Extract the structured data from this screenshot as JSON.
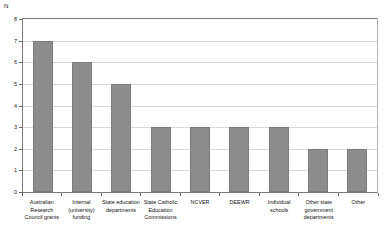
{
  "chart_data": {
    "type": "bar",
    "title": "",
    "subtitle": "",
    "xlabel": "",
    "ylabel": "N",
    "ylim": [
      0,
      8
    ],
    "ytick_labels": [
      "8",
      "7",
      "6",
      "5",
      "4",
      "3",
      "2",
      "1",
      "0"
    ],
    "ytick_values": [
      8,
      7,
      6,
      5,
      4,
      3,
      2,
      1,
      0
    ],
    "grid": true,
    "legend": null,
    "legend_position": "none",
    "bar_color": "#8c8c8c",
    "categories": [
      "Australian Research Council grants",
      "Internal (university) funding",
      "State education departments",
      "State Catholic Education Commissions",
      "NCVER",
      "DEEWR",
      "Individual schools",
      "Other state government departments",
      "Other"
    ],
    "values": [
      7,
      6,
      5,
      3,
      3,
      3,
      3,
      2,
      2
    ],
    "series": [
      {
        "name": "N",
        "values": [
          7,
          6,
          5,
          3,
          3,
          3,
          3,
          2,
          2
        ]
      }
    ]
  }
}
